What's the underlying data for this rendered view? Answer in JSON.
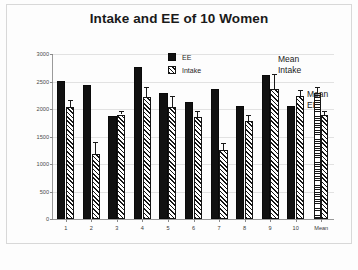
{
  "chart_data": {
    "type": "bar",
    "title": "Intake and EE of 10 Women",
    "xlabel": "",
    "ylabel": "",
    "ylim": [
      0,
      3000
    ],
    "yticks": [
      0,
      500,
      1000,
      1500,
      2000,
      2500,
      3000
    ],
    "ytick_labels": [
      "0",
      "500",
      "1000",
      "1500",
      "2000",
      "2500",
      "3000"
    ],
    "grid": true,
    "legend_position": "upper-center",
    "categories": [
      "1",
      "2",
      "3",
      "4",
      "5",
      "6",
      "7",
      "8",
      "9",
      "10",
      "Mean"
    ],
    "series": [
      {
        "name": "EE",
        "fill": "solid-black",
        "values": [
          2510,
          2430,
          1880,
          2770,
          2300,
          2120,
          2370,
          2050,
          2620,
          2060,
          null
        ]
      },
      {
        "name": "Intake",
        "fill": "diagonal-hatch",
        "values": [
          2030,
          1190,
          1900,
          2220,
          2040,
          1860,
          1250,
          1790,
          2360,
          2230,
          null
        ],
        "errors": [
          130,
          210,
          60,
          180,
          200,
          100,
          130,
          110,
          270,
          110,
          null
        ]
      },
      {
        "name": "Mean Intake",
        "fill": "horizontal-stripe",
        "values": [
          null,
          null,
          null,
          null,
          null,
          null,
          null,
          null,
          null,
          null,
          2300
        ],
        "errors": [
          null,
          null,
          null,
          null,
          null,
          null,
          null,
          null,
          null,
          null,
          100
        ]
      },
      {
        "name": "Mean EE",
        "fill": "diagonal-hatch",
        "values": [
          null,
          null,
          null,
          null,
          null,
          null,
          null,
          null,
          null,
          null,
          1890
        ],
        "errors": [
          null,
          null,
          null,
          null,
          null,
          null,
          null,
          null,
          null,
          null,
          70
        ]
      }
    ],
    "annotations": [
      {
        "text": "Mean Intake",
        "target": "mean-intake-bar"
      },
      {
        "text": "Mean EE",
        "target": "mean-ee-bar"
      }
    ]
  },
  "legend": {
    "items": [
      {
        "label": "EE",
        "swatch": "solid-black-swatch"
      },
      {
        "label": "Intake",
        "swatch": "diagonal-hatch-swatch"
      }
    ]
  },
  "annotations": {
    "mean_intake_line1": "Mean",
    "mean_intake_line2": "Intake",
    "mean_ee_line1": "Mean",
    "mean_ee_line2": "EE"
  }
}
